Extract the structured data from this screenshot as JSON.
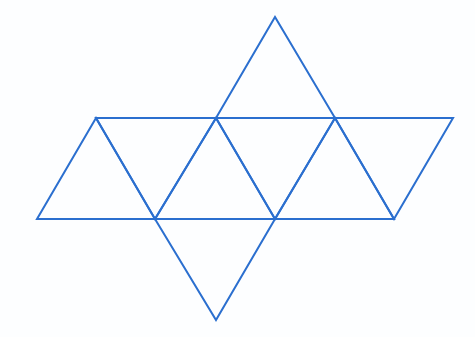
{
  "diagram": {
    "stroke_color": "#2b6fcf",
    "background_color": "#ffffff",
    "vertices": {
      "top": [
        275,
        17
      ],
      "u1": [
        96,
        118
      ],
      "u2": [
        216,
        118
      ],
      "u3": [
        335,
        118
      ],
      "u4": [
        453,
        118
      ],
      "l1": [
        37,
        219
      ],
      "l2": [
        155,
        219
      ],
      "l3": [
        275,
        219
      ],
      "l4": [
        394,
        219
      ],
      "bottom": [
        216,
        320
      ]
    },
    "faces": [
      {
        "name": "top-face",
        "points": [
          "u2",
          "top",
          "u3"
        ]
      },
      {
        "name": "row-face-1",
        "points": [
          "u1",
          "l1",
          "l2"
        ]
      },
      {
        "name": "row-face-2",
        "points": [
          "u1",
          "u2",
          "l2"
        ]
      },
      {
        "name": "row-face-3",
        "points": [
          "u2",
          "l2",
          "l3"
        ]
      },
      {
        "name": "row-face-4",
        "points": [
          "u2",
          "u3",
          "l3"
        ]
      },
      {
        "name": "row-face-5",
        "points": [
          "u3",
          "l3",
          "l4"
        ]
      },
      {
        "name": "row-face-6",
        "points": [
          "u3",
          "u4",
          "l4"
        ]
      },
      {
        "name": "bottom-face",
        "points": [
          "l2",
          "bottom",
          "l3"
        ]
      }
    ],
    "face_count": 8
  }
}
